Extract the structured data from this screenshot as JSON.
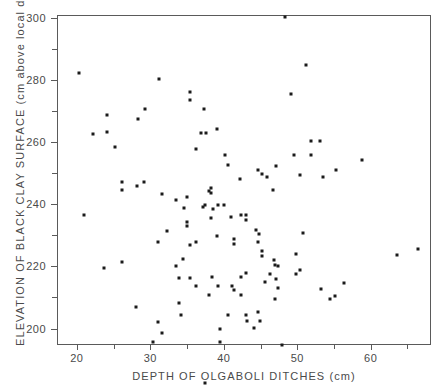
{
  "chart_data": {
    "type": "scatter",
    "title": "",
    "xlabel": "DEPTH OF OLGABOLI DITCHES (cm)",
    "ylabel": "ELEVATION OF BLACK CLAY SURFACE  (cm above local datum)",
    "xlim": [
      17.3,
      68.2
    ],
    "ylim": [
      194.7,
      300.9
    ],
    "xticks": [
      20,
      30,
      40,
      50,
      60
    ],
    "yticks": [
      200,
      220,
      240,
      260,
      280,
      300
    ],
    "xminorticks": [
      25,
      35,
      45,
      55,
      65
    ],
    "yminorticks": [
      210,
      230,
      250,
      270,
      290
    ],
    "grid": false,
    "legend": false,
    "marker": "square",
    "marker_color": "#1b1b1b",
    "marker_size_px": 3,
    "n_points": 115,
    "points": [
      [
        20.1,
        282.6
      ],
      [
        31.1,
        280.7
      ],
      [
        35.2,
        276.5
      ],
      [
        35.2,
        274.0
      ],
      [
        29.1,
        270.9
      ],
      [
        37.2,
        271.1
      ],
      [
        24.0,
        269.2
      ],
      [
        28.2,
        267.9
      ],
      [
        22.1,
        263.0
      ],
      [
        24.0,
        263.5
      ],
      [
        36.8,
        263.3
      ],
      [
        37.4,
        263.3
      ],
      [
        38.9,
        264.6
      ],
      [
        25.1,
        258.8
      ],
      [
        36.1,
        258.2
      ],
      [
        40.0,
        256.3
      ],
      [
        48.2,
        300.6
      ],
      [
        51.0,
        285.2
      ],
      [
        49.0,
        275.8
      ],
      [
        51.7,
        260.8
      ],
      [
        52.9,
        260.8
      ],
      [
        49.4,
        256.3
      ],
      [
        51.7,
        256.3
      ],
      [
        58.7,
        254.7
      ],
      [
        26.0,
        247.6
      ],
      [
        28.0,
        246.3
      ],
      [
        29.0,
        247.6
      ],
      [
        26.0,
        245.0
      ],
      [
        31.4,
        243.7
      ],
      [
        37.9,
        244.7
      ],
      [
        33.4,
        241.8
      ],
      [
        34.5,
        239.2
      ],
      [
        26.0,
        221.8
      ],
      [
        33.4,
        220.5
      ],
      [
        27.9,
        207.1
      ],
      [
        30.9,
        202.3
      ],
      [
        31.5,
        199.0
      ],
      [
        40.4,
        252.8
      ],
      [
        42.1,
        248.3
      ],
      [
        44.5,
        251.5
      ],
      [
        45.7,
        249.0
      ],
      [
        38.1,
        245.7
      ],
      [
        38.1,
        243.8
      ],
      [
        34.9,
        242.8
      ],
      [
        37.3,
        240.2
      ],
      [
        39.1,
        240.2
      ],
      [
        39.9,
        240.2
      ],
      [
        42.2,
        236.7
      ],
      [
        42.9,
        237.0
      ],
      [
        42.9,
        235.4
      ],
      [
        40.9,
        236.3
      ],
      [
        38.1,
        236.0
      ],
      [
        34.9,
        234.7
      ],
      [
        34.9,
        233.4
      ],
      [
        44.2,
        232.1
      ],
      [
        44.6,
        230.8
      ],
      [
        38.9,
        230.2
      ],
      [
        36.1,
        228.3
      ],
      [
        41.2,
        229.0
      ],
      [
        41.2,
        227.4
      ],
      [
        32.2,
        231.8
      ],
      [
        55.2,
        251.5
      ],
      [
        47.0,
        252.5
      ],
      [
        50.2,
        249.6
      ],
      [
        53.4,
        249.0
      ],
      [
        45.0,
        250.2
      ],
      [
        46.6,
        245.0
      ],
      [
        44.5,
        228.3
      ],
      [
        50.7,
        231.1
      ],
      [
        45.0,
        225.4
      ],
      [
        45.0,
        223.8
      ],
      [
        46.7,
        222.5
      ],
      [
        49.7,
        224.4
      ],
      [
        46.9,
        220.9
      ],
      [
        47.3,
        220.6
      ],
      [
        50.2,
        219.3
      ],
      [
        49.7,
        218.0
      ],
      [
        46.2,
        218.0
      ],
      [
        47.0,
        216.4
      ],
      [
        35.2,
        216.5
      ],
      [
        36.1,
        213.9
      ],
      [
        38.2,
        216.8
      ],
      [
        39.1,
        213.9
      ],
      [
        41.0,
        213.9
      ],
      [
        41.2,
        212.6
      ],
      [
        42.2,
        216.8
      ],
      [
        34.1,
        204.6
      ],
      [
        40.4,
        204.6
      ],
      [
        44.5,
        205.5
      ],
      [
        44.8,
        202.9
      ],
      [
        44.0,
        200.6
      ],
      [
        42.9,
        218.3
      ],
      [
        45.5,
        215.4
      ],
      [
        37.9,
        211.0
      ],
      [
        42.2,
        211.0
      ],
      [
        46.9,
        209.9
      ],
      [
        47.8,
        194.9
      ],
      [
        37.3,
        182.7
      ],
      [
        37.0,
        239.4
      ],
      [
        38.4,
        238.8
      ],
      [
        30.9,
        228.3
      ],
      [
        34.3,
        222.8
      ],
      [
        33.7,
        216.5
      ],
      [
        47.3,
        213.5
      ],
      [
        42.9,
        204.6
      ],
      [
        55.0,
        210.7
      ],
      [
        53.1,
        213.2
      ],
      [
        66.3,
        225.9
      ],
      [
        63.4,
        224.0
      ],
      [
        56.2,
        214.9
      ],
      [
        54.3,
        209.9
      ],
      [
        35.2,
        227.3
      ],
      [
        33.7,
        208.7
      ],
      [
        43.0,
        202.9
      ],
      [
        39.3,
        200.3
      ],
      [
        30.2,
        195.9
      ],
      [
        20.8,
        237.0
      ],
      [
        23.5,
        219.7
      ],
      [
        39.3,
        195.9
      ]
    ]
  },
  "axis": {
    "xticklabels": [
      "20",
      "30",
      "40",
      "50",
      "60"
    ],
    "yticklabels": [
      "200",
      "220",
      "240",
      "260",
      "280",
      "300"
    ]
  }
}
